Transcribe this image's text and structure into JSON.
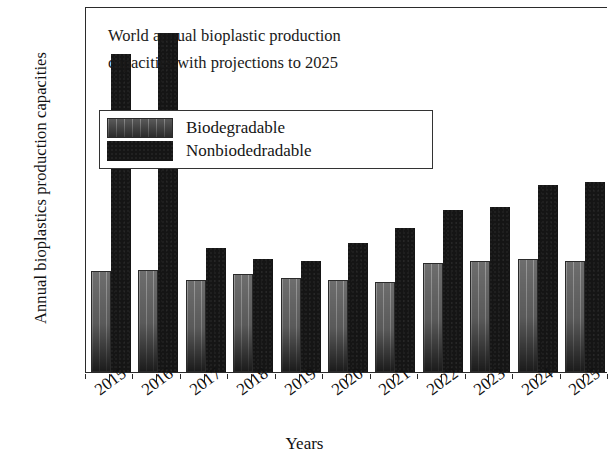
{
  "chart_data": {
    "type": "bar",
    "title": "World annual bioplastic production capacities with projections to 2025",
    "title_line1": "World annual bioplastic production",
    "title_line2": "capacities with projections to 2025",
    "xlabel": "Years",
    "ylabel": "Annual bioplastics production capacities",
    "categories": [
      "2015",
      "2016",
      "2017",
      "2018",
      "2019",
      "2020",
      "2021",
      "2022",
      "2023",
      "2024",
      "2025"
    ],
    "series": [
      {
        "name": "Biodegradable",
        "color": "#6d6d6d",
        "values": [
          950,
          960,
          870,
          920,
          890,
          870,
          850,
          1030,
          1050,
          1070,
          1050
        ]
      },
      {
        "name": "Nonbiodedradable",
        "color": "#151515",
        "values": [
          3000,
          3200,
          1170,
          1070,
          1050,
          1220,
          1360,
          1530,
          1560,
          1760,
          1790
        ]
      }
    ],
    "ylim": [
      0,
      3450
    ],
    "ytick_major": [
      500,
      1000,
      1500,
      2000,
      2500,
      3000
    ],
    "ytick_major_labels": [
      "500",
      "1000",
      "1500",
      "2000",
      "2500",
      "3000"
    ],
    "ytick_minor": [
      250,
      750,
      1250,
      1750,
      2250,
      2750,
      3250
    ],
    "grid": false,
    "legend_position": "upper-center-left",
    "legend_entries": [
      "Biodegradable",
      "Nonbiodedradable"
    ]
  }
}
